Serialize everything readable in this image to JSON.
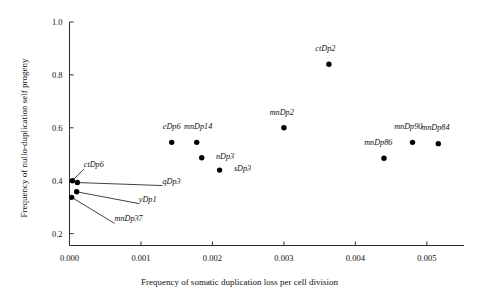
{
  "chart_data": {
    "type": "scatter",
    "title": "",
    "xlabel": "Frequency of somatic duplication loss per cell division",
    "ylabel": "Frequency of nullo-duplication self progeny",
    "xlim": [
      0.0,
      0.00552
    ],
    "ylim": [
      0.155,
      1.0
    ],
    "xticks": [
      0.0,
      0.001,
      0.002,
      0.003,
      0.004,
      0.005
    ],
    "xtick_labels": [
      "0.000",
      "0.001",
      "0.002",
      "0.003",
      "0.004",
      "0.005"
    ],
    "yticks": [
      0.2,
      0.4,
      0.6,
      0.8,
      1.0
    ],
    "ytick_labels": [
      "0.2",
      "0.4",
      "0.6",
      "0.8",
      "1.0"
    ],
    "grid": false,
    "legend": "none",
    "marker": "filled-circle",
    "points": [
      {
        "label": "ctDp6",
        "x": 4e-05,
        "y": 0.4,
        "label_x": 0.0002,
        "label_y": 0.455,
        "anchor": "start",
        "leader": true
      },
      {
        "label": "qDp3",
        "x": 0.00011,
        "y": 0.393,
        "label_x": 0.0013,
        "label_y": 0.393,
        "anchor": "start",
        "leader": true
      },
      {
        "label": "yDp1",
        "x": 0.0001,
        "y": 0.358,
        "label_x": 0.00097,
        "label_y": 0.325,
        "anchor": "start",
        "leader": true
      },
      {
        "label": "mnDp37",
        "x": 3e-05,
        "y": 0.337,
        "label_x": 0.00063,
        "label_y": 0.25,
        "anchor": "start",
        "leader": true
      },
      {
        "label": "eDp6",
        "x": 0.00143,
        "y": 0.545,
        "label_x": 0.00143,
        "label_y": 0.6,
        "anchor": "middle",
        "leader": false
      },
      {
        "label": "mnDp14",
        "x": 0.00178,
        "y": 0.545,
        "label_x": 0.0018,
        "label_y": 0.6,
        "anchor": "middle",
        "leader": false
      },
      {
        "label": "nDp3",
        "x": 0.00185,
        "y": 0.487,
        "label_x": 0.00205,
        "label_y": 0.487,
        "anchor": "start",
        "leader": false
      },
      {
        "label": "sDp3",
        "x": 0.0021,
        "y": 0.44,
        "label_x": 0.0023,
        "label_y": 0.44,
        "anchor": "start",
        "leader": false
      },
      {
        "label": "mnDp2",
        "x": 0.003,
        "y": 0.6,
        "label_x": 0.00297,
        "label_y": 0.653,
        "anchor": "middle",
        "leader": false
      },
      {
        "label": "ctDp2",
        "x": 0.00363,
        "y": 0.84,
        "label_x": 0.00358,
        "label_y": 0.895,
        "anchor": "middle",
        "leader": false
      },
      {
        "label": "mnDp86",
        "x": 0.0044,
        "y": 0.485,
        "label_x": 0.00432,
        "label_y": 0.54,
        "anchor": "middle",
        "leader": false
      },
      {
        "label": "mnDp90",
        "x": 0.0048,
        "y": 0.545,
        "label_x": 0.00474,
        "label_y": 0.6,
        "anchor": "middle",
        "leader": false
      },
      {
        "label": "mnDp84",
        "x": 0.00516,
        "y": 0.54,
        "label_x": 0.00512,
        "label_y": 0.595,
        "anchor": "middle",
        "leader": false
      }
    ]
  }
}
